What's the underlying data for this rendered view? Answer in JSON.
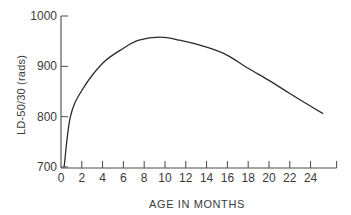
{
  "chart_data": {
    "type": "line",
    "title": "",
    "xlabel": "AGE IN MONTHS",
    "ylabel": "LD-50/30 (rads)",
    "xlim": [
      0,
      26
    ],
    "ylim": [
      700,
      1000
    ],
    "grid": false,
    "legend": null,
    "x_ticks": [
      0,
      2,
      4,
      6,
      8,
      10,
      12,
      14,
      16,
      18,
      20,
      22,
      24
    ],
    "y_ticks": [
      700,
      800,
      900,
      1000
    ],
    "series": [
      {
        "name": "LD-50/30",
        "x": [
          0.3,
          0.9,
          2,
          4,
          6,
          7.5,
          9.5,
          11.4,
          14,
          16,
          18,
          20,
          22,
          25.2
        ],
        "y": [
          700,
          800,
          852,
          906,
          936,
          952,
          958,
          952,
          938,
          922,
          896,
          872,
          846,
          806
        ]
      }
    ]
  },
  "colors": {
    "line": "#2a2a2a",
    "axis": "#4a4a4a",
    "text": "#3a3a3a",
    "background": "#ffffff"
  }
}
